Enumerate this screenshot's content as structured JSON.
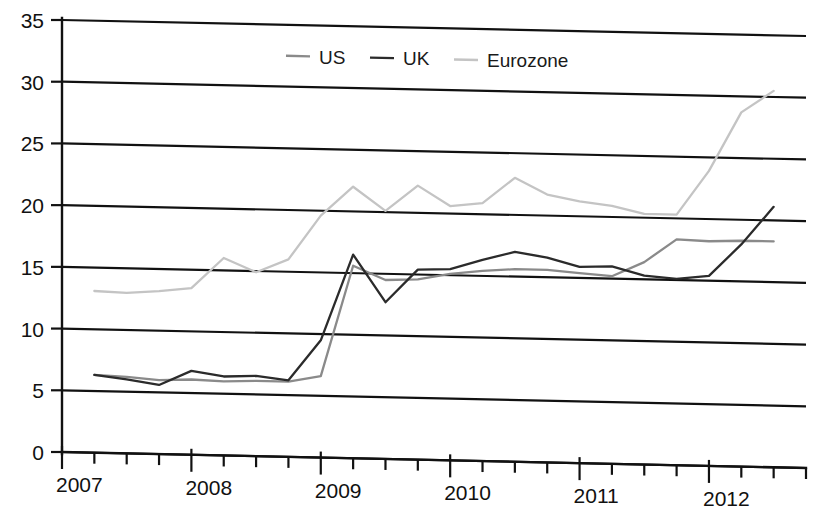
{
  "chart_data": {
    "type": "line",
    "title": "",
    "xlabel": "",
    "ylabel": "",
    "ylim": [
      0,
      35
    ],
    "xlim": [
      2007.0,
      2012.75
    ],
    "yticks": [
      0,
      5,
      10,
      15,
      20,
      25,
      30,
      35
    ],
    "ytick_labels": [
      "0",
      "5",
      "10",
      "15",
      "20",
      "25",
      "30",
      "35"
    ],
    "xticks": [
      2007,
      2008,
      2009,
      2010,
      2011,
      2012
    ],
    "xtick_labels": [
      "2007",
      "2008",
      "2009",
      "2010",
      "2011",
      "2012"
    ],
    "minor_xticks_per_year": 4,
    "grid": "horizontal",
    "legend_position": "top-center",
    "x": [
      2007.25,
      2007.5,
      2007.75,
      2008.0,
      2008.25,
      2008.5,
      2008.75,
      2009.0,
      2009.25,
      2009.5,
      2009.75,
      2010.0,
      2010.25,
      2010.5,
      2010.75,
      2011.0,
      2011.25,
      2011.5,
      2011.75,
      2012.0,
      2012.25,
      2012.5
    ],
    "series": [
      {
        "name": "US",
        "color": "#8a8a8a",
        "values": [
          6.3,
          6.2,
          6.0,
          6.1,
          6.0,
          6.1,
          6.1,
          6.6,
          15.6,
          14.5,
          14.6,
          15.1,
          15.4,
          15.6,
          15.6,
          15.4,
          15.2,
          16.4,
          18.3,
          18.2,
          18.3,
          18.3
        ]
      },
      {
        "name": "UK",
        "color": "#2b2b2b",
        "values": [
          6.3,
          6.0,
          5.6,
          6.8,
          6.4,
          6.5,
          6.2,
          9.5,
          16.5,
          12.7,
          15.4,
          15.5,
          16.3,
          17.0,
          16.6,
          15.9,
          16.0,
          15.3,
          15.1,
          15.4,
          18.0,
          21.1
        ]
      },
      {
        "name": "Eurozone",
        "color": "#c4c4c4",
        "values": [
          13.1,
          13.0,
          13.2,
          13.5,
          16.0,
          14.9,
          16.0,
          19.6,
          22.0,
          20.1,
          22.2,
          20.6,
          20.9,
          23.0,
          21.7,
          21.2,
          20.9,
          20.3,
          20.3,
          23.9,
          28.7,
          30.5
        ]
      }
    ]
  },
  "legend": {
    "items": [
      {
        "label": "US",
        "color": "#8a8a8a"
      },
      {
        "label": "UK",
        "color": "#2b2b2b"
      },
      {
        "label": "Eurozone",
        "color": "#c4c4c4"
      }
    ]
  }
}
